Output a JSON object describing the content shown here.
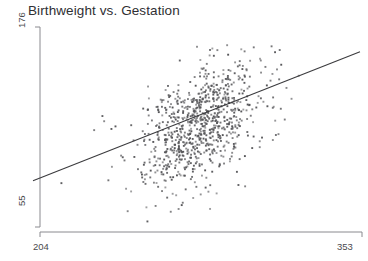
{
  "chart_data": {
    "type": "scatter",
    "title": "Birthweight vs. Gestation",
    "xlabel": "",
    "ylabel": "",
    "xlim": [
      204,
      353
    ],
    "ylim": [
      55,
      176
    ],
    "xticks": [
      204,
      353
    ],
    "yticks": [
      55,
      176
    ],
    "xtick_labels": [
      "204",
      "353"
    ],
    "ytick_labels": [
      "55",
      "176"
    ],
    "grid": false,
    "legend": null,
    "series": [
      {
        "name": "observations",
        "marker": "square",
        "marker_size": 1.4,
        "color": "#555558",
        "n_points": 860,
        "description": "Dense positively-correlated cloud of birthweight vs gestation observations; core cluster concentrated near gestation 272-286 and birthweight 105-130, thinning toward both tails.",
        "x_center": 279,
        "y_center": 118,
        "x_spread": 13,
        "y_spread": 18,
        "correlation": 0.45
      },
      {
        "name": "regression-line",
        "type": "line",
        "color": "#3b3b3e",
        "width": 1.1,
        "x_start": 204,
        "y_start": 83,
        "x_end": 353,
        "y_end": 161,
        "slope": 0.523,
        "intercept": -23.8
      }
    ],
    "axis": {
      "line_color": "#8a8a8f",
      "y_axis_x_px": 40,
      "y_axis_top_px": 27,
      "y_axis_bottom_px": 227,
      "x_axis_y_px": 232,
      "x_axis_left_px": 40,
      "x_axis_right_px": 362
    }
  },
  "colors": {
    "background": "#ffffff",
    "title": "#2f2f33",
    "tick_label": "#4a4a4e",
    "axis_line": "#8a8a8f",
    "point": "#555558",
    "trend_line": "#3b3b3e"
  }
}
